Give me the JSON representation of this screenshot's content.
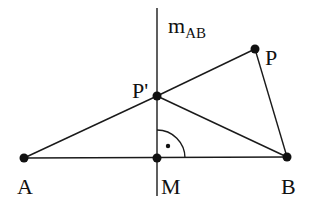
{
  "diagram": {
    "points": [
      {
        "id": "A",
        "label": "A",
        "x": 24,
        "y": 158,
        "lx": 18,
        "ly": 194
      },
      {
        "id": "B",
        "label": "B",
        "x": 287,
        "y": 157,
        "lx": 282,
        "ly": 194
      },
      {
        "id": "M",
        "label": "M",
        "x": 157,
        "y": 158,
        "lx": 161,
        "ly": 194
      },
      {
        "id": "P",
        "label": "P",
        "x": 255,
        "y": 49,
        "lx": 266,
        "ly": 65
      },
      {
        "id": "Pprime",
        "label": "P'",
        "x": 157,
        "y": 96,
        "lx": 132,
        "ly": 98
      }
    ],
    "bisector": {
      "label_main": "m",
      "label_sub": "AB",
      "x": 157,
      "y1": 8,
      "y2": 196
    },
    "segments": [
      [
        "A",
        "B"
      ],
      [
        "A",
        "Pprime"
      ],
      [
        "Pprime",
        "P"
      ],
      [
        "Pprime",
        "B"
      ],
      [
        "P",
        "B"
      ]
    ],
    "right_angle": {
      "at": "M",
      "radius": 28
    }
  }
}
